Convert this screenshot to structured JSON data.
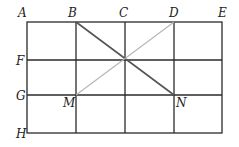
{
  "diagram": {
    "type": "rectangular grid (4 columns x 3 rows) with diagonals",
    "labels": {
      "A": "A",
      "B": "B",
      "C": "C",
      "D": "D",
      "E": "E",
      "F": "F",
      "G": "G",
      "H": "H",
      "M": "M",
      "N": "N"
    },
    "segments": [
      {
        "from": "B",
        "to": "N",
        "style": "dark"
      },
      {
        "from": "D",
        "to": "M",
        "style": "light"
      }
    ],
    "colors": {
      "grid": "#2a2a2a",
      "diag_dark": "#555555",
      "diag_light": "#b5b5b5",
      "label": "#222222"
    }
  }
}
